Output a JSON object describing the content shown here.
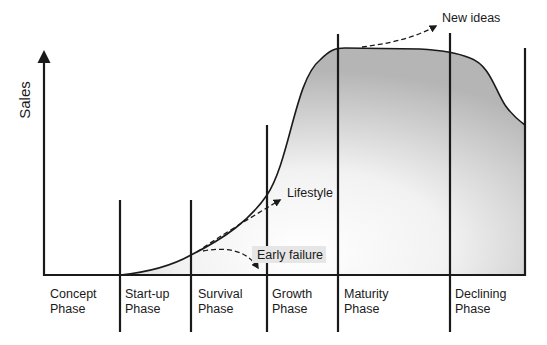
{
  "diagram": {
    "y_axis_label": "Sales",
    "phases": [
      {
        "line1": "Concept",
        "line2": "Phase"
      },
      {
        "line1": "Start-up",
        "line2": "Phase"
      },
      {
        "line1": "Survival",
        "line2": "Phase"
      },
      {
        "line1": "Growth",
        "line2": "Phase"
      },
      {
        "line1": "Maturity",
        "line2": "Phase"
      },
      {
        "line1": "Declining",
        "line2": "Phase"
      }
    ],
    "annotations": {
      "new_ideas": "New ideas",
      "lifestyle": "Lifestyle",
      "early_failure": "Early failure"
    },
    "colors": {
      "line": "#1a1a1a",
      "fill_dark": "#b8b8b8",
      "fill_light": "#ffffff",
      "label_highlight": "#e6e6e6"
    }
  }
}
